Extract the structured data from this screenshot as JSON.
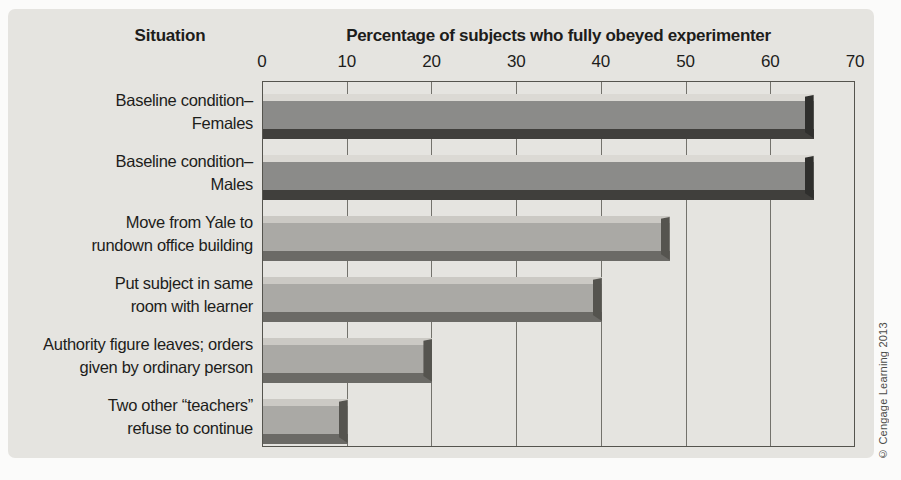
{
  "header": {
    "situation_label": "Situation"
  },
  "chart_data": {
    "type": "bar",
    "orientation": "horizontal",
    "title": "Percentage of subjects who fully obeyed experimenter",
    "xlabel": "Percentage of subjects who fully obeyed experimenter",
    "ylabel": "Situation",
    "xlim": [
      0,
      70
    ],
    "ticks": [
      0,
      10,
      20,
      30,
      40,
      50,
      60,
      70
    ],
    "grid": "vertical",
    "categories": [
      "Baseline condition–\nFemales",
      "Baseline condition–\nMales",
      "Move from Yale to\nrundown office building",
      "Put subject in same\nroom with learner",
      "Authority figure leaves; orders\ngiven by ordinary person",
      "Two other “teachers”\nrefuse to continue"
    ],
    "values": [
      65,
      65,
      48,
      40,
      20,
      10
    ],
    "bar_styles": [
      "dark",
      "dark",
      "light",
      "light",
      "light",
      "light"
    ]
  },
  "colors": {
    "page_bg": "#fbfbfa",
    "panel_bg": "#e5e4e0",
    "plot_border": "#55544e",
    "gridline": "#73726c",
    "text": "#1d1d1b",
    "bar_dark": {
      "highlight": "#dbd9d4",
      "body": "#8b8b89",
      "shadow": "#403f3c",
      "cap": "#2f2f2d"
    },
    "bar_light": {
      "highlight": "#cbc9c4",
      "body": "#aaa9a5",
      "shadow": "#6b6a66",
      "cap": "#55544f"
    }
  },
  "footer": {
    "copyright": "© Cengage Learning 2013"
  }
}
